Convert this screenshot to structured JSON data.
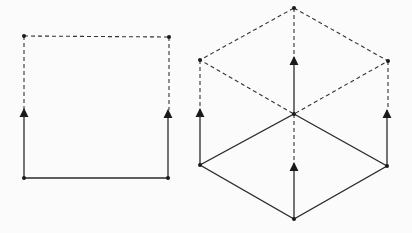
{
  "diagram": {
    "title": "",
    "figures": [
      {
        "name": "square-extrusion",
        "description": "2D segment extruded upward into a square"
      },
      {
        "name": "rhombus-extrusion",
        "description": "rhombus extruded upward into a cube"
      }
    ],
    "colors": {
      "line": "#2a2a2a",
      "background": "#fbfbfb"
    }
  }
}
